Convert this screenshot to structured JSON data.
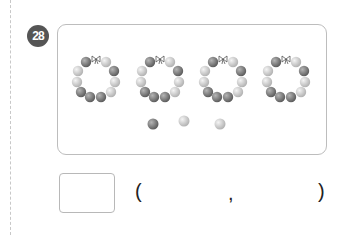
{
  "problem": {
    "number": "28",
    "answer_box_value": "",
    "choices": {
      "open_paren": "(",
      "separator": ",",
      "close_paren": ")",
      "left_value": "",
      "right_value": ""
    }
  },
  "illustration": {
    "bracelets_count": 4,
    "bead_colors": {
      "dark": "#7d7d7d",
      "light": "#cfcfcf"
    },
    "loose_beads": [
      "dark",
      "light",
      "light"
    ]
  }
}
